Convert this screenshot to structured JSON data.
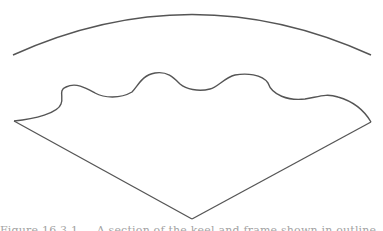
{
  "figure": {
    "stroke_color": "#555555",
    "background": "#ffffff",
    "shapes": {
      "outer_arc": {
        "start": [
          13,
          55
        ],
        "peak": [
          192,
          14
        ],
        "end": [
          371,
          55
        ]
      },
      "wavy_edge": {
        "start": [
          14,
          121
        ],
        "end": [
          371,
          122
        ]
      },
      "bottom_vertex": [
        192,
        219
      ]
    },
    "caption": "Figure 16.3.1 — A section of the keel and frame shown in outline, with the wavy edge indicating the cut."
  }
}
